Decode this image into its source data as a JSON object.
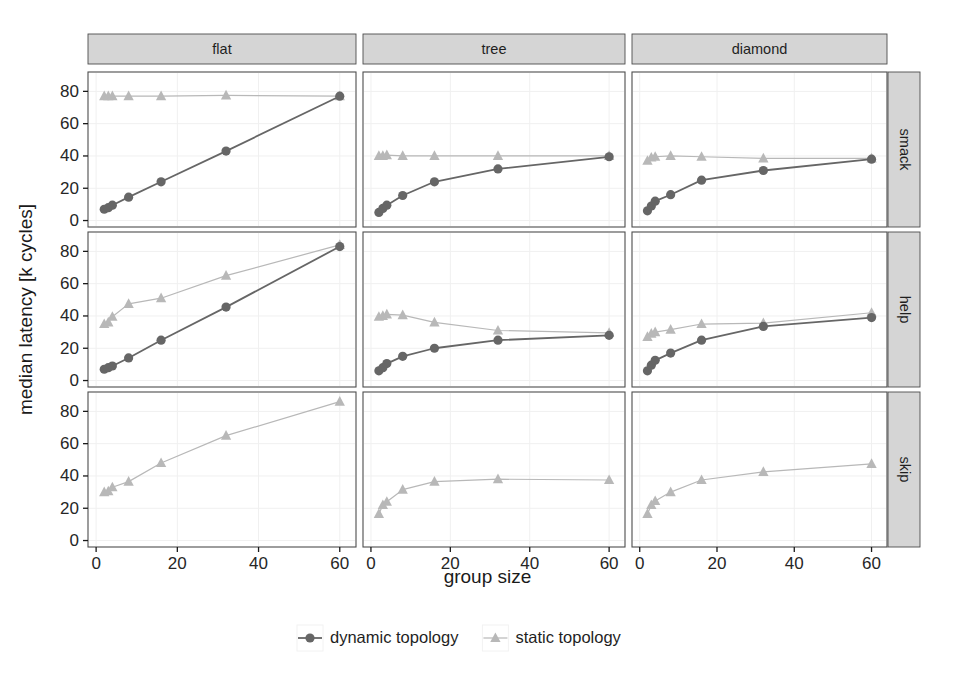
{
  "figure": {
    "axis_titles": {
      "x": "group size",
      "y": "median latency [k cycles]"
    },
    "column_strips": [
      "flat",
      "tree",
      "diamond"
    ],
    "row_strips": [
      "smack",
      "help",
      "skip"
    ],
    "legend": {
      "entries": [
        {
          "label": "dynamic topology",
          "marker": "circle",
          "color": "#666666"
        },
        {
          "label": "static topology",
          "marker": "triangle",
          "color": "#b8b8b8"
        }
      ]
    },
    "colors": {
      "dynamic": "#666666",
      "static": "#b8b8b8",
      "strip_fill": "#d5d5d5",
      "panel_border": "#4d4d4d",
      "grid": "#f0f0f0",
      "background": "#ffffff"
    },
    "x_ticks": [
      0,
      20,
      40,
      60
    ],
    "y_ticks": [
      0,
      20,
      40,
      60,
      80
    ]
  },
  "chart_data": {
    "type": "line",
    "title": "",
    "xlabel": "group size",
    "ylabel": "median latency [k cycles]",
    "xlim": [
      -2,
      64
    ],
    "ylim": [
      -4,
      92
    ],
    "grid": true,
    "legend_position": "bottom",
    "facet_columns": [
      "flat",
      "tree",
      "diamond"
    ],
    "facet_rows": [
      "smack",
      "help",
      "skip"
    ],
    "x": [
      2,
      3,
      4,
      8,
      16,
      32,
      60
    ],
    "panels": [
      {
        "row": "smack",
        "col": "flat",
        "series": [
          {
            "name": "dynamic topology",
            "x": [
              2,
              3,
              4,
              8,
              16,
              32,
              60
            ],
            "values": [
              7,
              8,
              9.5,
              14.5,
              24,
              43,
              77
            ]
          },
          {
            "name": "static topology",
            "x": [
              2,
              3,
              4,
              8,
              16,
              32,
              60
            ],
            "values": [
              77,
              77,
              77,
              77,
              77,
              77.5,
              77
            ]
          }
        ]
      },
      {
        "row": "smack",
        "col": "tree",
        "series": [
          {
            "name": "dynamic topology",
            "x": [
              2,
              3,
              4,
              8,
              16,
              32,
              60
            ],
            "values": [
              5,
              7.5,
              9.5,
              15.5,
              24,
              32,
              39.5
            ]
          },
          {
            "name": "static topology",
            "x": [
              2,
              3,
              4,
              8,
              16,
              32,
              60
            ],
            "values": [
              40,
              40,
              40.5,
              40,
              40,
              40,
              40
            ]
          }
        ]
      },
      {
        "row": "smack",
        "col": "diamond",
        "series": [
          {
            "name": "dynamic topology",
            "x": [
              2,
              3,
              4,
              8,
              16,
              32,
              60
            ],
            "values": [
              6,
              9,
              12,
              16,
              25,
              31,
              38
            ]
          },
          {
            "name": "static topology",
            "x": [
              2,
              3,
              4,
              8,
              16,
              32,
              60
            ],
            "values": [
              37,
              39,
              39.5,
              40,
              39.5,
              38.5,
              38.5
            ]
          }
        ]
      },
      {
        "row": "help",
        "col": "flat",
        "series": [
          {
            "name": "dynamic topology",
            "x": [
              2,
              3,
              4,
              8,
              16,
              32,
              60
            ],
            "values": [
              7,
              8,
              9,
              14,
              25,
              45.5,
              83
            ]
          },
          {
            "name": "static topology",
            "x": [
              2,
              3,
              4,
              8,
              16,
              32,
              60
            ],
            "values": [
              35,
              36,
              39.5,
              47.5,
              51,
              65,
              84
            ]
          }
        ]
      },
      {
        "row": "help",
        "col": "tree",
        "series": [
          {
            "name": "dynamic topology",
            "x": [
              2,
              3,
              4,
              8,
              16,
              32,
              60
            ],
            "values": [
              6,
              8,
              10.5,
              15,
              20,
              25,
              28
            ]
          },
          {
            "name": "static topology",
            "x": [
              2,
              3,
              4,
              8,
              16,
              32,
              60
            ],
            "values": [
              39.5,
              40,
              41,
              40.5,
              36,
              31,
              29.5
            ]
          }
        ]
      },
      {
        "row": "help",
        "col": "diamond",
        "series": [
          {
            "name": "dynamic topology",
            "x": [
              2,
              3,
              4,
              8,
              16,
              32,
              60
            ],
            "values": [
              6,
              9.5,
              12.5,
              17,
              25,
              33.5,
              39
            ]
          },
          {
            "name": "static topology",
            "x": [
              2,
              3,
              4,
              8,
              16,
              32,
              60
            ],
            "values": [
              27,
              29,
              30,
              31.5,
              35,
              35.5,
              42
            ]
          }
        ]
      },
      {
        "row": "skip",
        "col": "flat",
        "series": [
          {
            "name": "static topology",
            "x": [
              2,
              3,
              4,
              8,
              16,
              32,
              60
            ],
            "values": [
              30,
              30.5,
              33,
              36.5,
              48,
              65,
              86
            ]
          }
        ]
      },
      {
        "row": "skip",
        "col": "tree",
        "series": [
          {
            "name": "static topology",
            "x": [
              2,
              3,
              4,
              8,
              16,
              32,
              60
            ],
            "values": [
              16.5,
              22,
              24,
              31.5,
              36.5,
              38,
              37.5
            ]
          }
        ]
      },
      {
        "row": "skip",
        "col": "diamond",
        "series": [
          {
            "name": "static topology",
            "x": [
              2,
              3,
              4,
              8,
              16,
              32,
              60
            ],
            "values": [
              16.5,
              22,
              24.5,
              30,
              37.5,
              42.5,
              47.5
            ]
          }
        ]
      }
    ]
  }
}
